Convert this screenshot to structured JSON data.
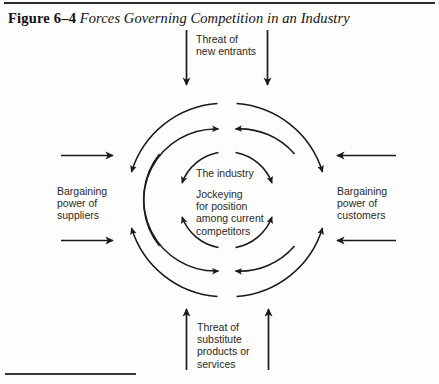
{
  "figure": {
    "number": "Figure 6–4",
    "title": "Forces Governing Competition in an Industry"
  },
  "diagram": {
    "type": "five-forces",
    "center_labels": {
      "industry": "The industry",
      "rivalry": "Jockeying\nfor position\namong current\ncompetitors"
    },
    "forces": [
      {
        "id": "new-entrants",
        "position": "top",
        "label": "Threat of\nnew entrants",
        "arrow_direction": "down",
        "arrow_count": 2
      },
      {
        "id": "suppliers",
        "position": "left",
        "label": "Bargaining\npower of\nsuppliers",
        "arrow_direction": "right",
        "arrow_count": 2
      },
      {
        "id": "customers",
        "position": "right",
        "label": "Bargaining\npower of\ncustomers",
        "arrow_direction": "left",
        "arrow_count": 2
      },
      {
        "id": "substitutes",
        "position": "bottom",
        "label": "Threat of\nsubstitute\nproducts or\nservices",
        "arrow_direction": "up",
        "arrow_count": 2
      }
    ],
    "rings": [
      {
        "id": "outer-ring",
        "radius": 97
      },
      {
        "id": "middle-ring",
        "radius": 72
      },
      {
        "id": "inner-ring",
        "radius": 48
      }
    ],
    "colors": {
      "ink": "#1a1a1a",
      "text": "#2a2a2a",
      "page": "#fdfdfc"
    }
  }
}
